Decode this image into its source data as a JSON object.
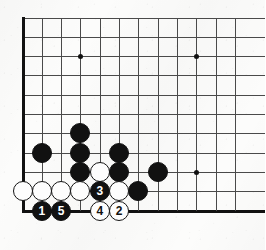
{
  "diagram": {
    "kind": "go-board-diagram",
    "title": "",
    "board": {
      "corner": "bottom-left",
      "visible_columns": 12,
      "visible_rows": 11,
      "line_color": "#4a4a4a",
      "edge_color": "#111111",
      "background_color": "#fcfcfb",
      "spacing_px": 19.33,
      "origin_x": 22.5,
      "origin_y": 17.5,
      "star_points": [
        {
          "col": 4,
          "row": 3
        },
        {
          "col": 10,
          "row": 3
        },
        {
          "col": 10,
          "row": 9
        }
      ]
    },
    "stones": [
      {
        "col": 2,
        "row": 8,
        "color": "black",
        "label": ""
      },
      {
        "col": 4,
        "row": 7,
        "color": "black",
        "label": ""
      },
      {
        "col": 4,
        "row": 8,
        "color": "black",
        "label": ""
      },
      {
        "col": 4,
        "row": 9,
        "color": "black",
        "label": ""
      },
      {
        "col": 5,
        "row": 9,
        "color": "white",
        "label": ""
      },
      {
        "col": 6,
        "row": 8,
        "color": "black",
        "label": ""
      },
      {
        "col": 6,
        "row": 9,
        "color": "black",
        "label": ""
      },
      {
        "col": 8,
        "row": 9,
        "color": "black",
        "label": ""
      },
      {
        "col": 7,
        "row": 10,
        "color": "black",
        "label": ""
      },
      {
        "col": 1,
        "row": 10,
        "color": "white",
        "label": ""
      },
      {
        "col": 2,
        "row": 10,
        "color": "white",
        "label": ""
      },
      {
        "col": 3,
        "row": 10,
        "color": "white",
        "label": ""
      },
      {
        "col": 4,
        "row": 10,
        "color": "white",
        "label": ""
      },
      {
        "col": 5,
        "row": 10,
        "color": "black",
        "label": "3"
      },
      {
        "col": 6,
        "row": 10,
        "color": "white",
        "label": ""
      },
      {
        "col": 2,
        "row": 11,
        "color": "black",
        "label": "1"
      },
      {
        "col": 3,
        "row": 11,
        "color": "black",
        "label": "5"
      },
      {
        "col": 5,
        "row": 11,
        "color": "white",
        "label": "4"
      },
      {
        "col": 6,
        "row": 11,
        "color": "white",
        "label": "2"
      }
    ],
    "move_sequence": [
      {
        "number": "1",
        "color": "black"
      },
      {
        "number": "2",
        "color": "white"
      },
      {
        "number": "3",
        "color": "black"
      },
      {
        "number": "4",
        "color": "white"
      },
      {
        "number": "5",
        "color": "black"
      }
    ]
  }
}
